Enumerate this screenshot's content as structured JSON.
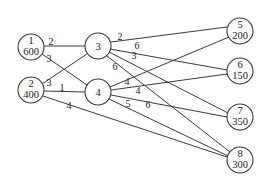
{
  "diagram": {
    "type": "transportation-network",
    "nodes": [
      {
        "id": "1",
        "value": "600",
        "x": 31,
        "y": 47
      },
      {
        "id": "2",
        "value": "400",
        "x": 31,
        "y": 90
      },
      {
        "id": "3",
        "value": "",
        "x": 98,
        "y": 46
      },
      {
        "id": "4",
        "value": "",
        "x": 98,
        "y": 92
      },
      {
        "id": "5",
        "value": "200",
        "x": 240,
        "y": 31
      },
      {
        "id": "6",
        "value": "150",
        "x": 240,
        "y": 71
      },
      {
        "id": "7",
        "value": "350",
        "x": 240,
        "y": 117
      },
      {
        "id": "8",
        "value": "300",
        "x": 240,
        "y": 160
      }
    ],
    "edges": [
      {
        "from": "1",
        "to": "3",
        "weight": "2"
      },
      {
        "from": "1",
        "to": "4",
        "weight": "3"
      },
      {
        "from": "2",
        "to": "3",
        "weight": "3"
      },
      {
        "from": "2",
        "to": "4",
        "weight": "1"
      },
      {
        "from": "2",
        "to": "8",
        "weight": "4"
      },
      {
        "from": "3",
        "to": "5",
        "weight": "2"
      },
      {
        "from": "3",
        "to": "6",
        "weight": "6"
      },
      {
        "from": "3",
        "to": "7",
        "weight": "3"
      },
      {
        "from": "3",
        "to": "8",
        "weight": "6"
      },
      {
        "from": "4",
        "to": "5",
        "weight": "4"
      },
      {
        "from": "4",
        "to": "6",
        "weight": "4"
      },
      {
        "from": "4",
        "to": "7",
        "weight": "6"
      },
      {
        "from": "4",
        "to": "8",
        "weight": "5"
      }
    ]
  }
}
